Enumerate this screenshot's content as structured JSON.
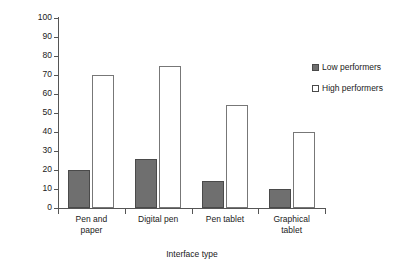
{
  "chart_data": {
    "type": "bar",
    "title": "",
    "xlabel": "Interface type",
    "ylabel": "Percent correct inferences",
    "categories": [
      "Pen and paper",
      "Digital pen",
      "Pen tablet",
      "Graphical tablet"
    ],
    "category_lines": [
      [
        "Pen and",
        "paper"
      ],
      [
        "Digital pen"
      ],
      [
        "Pen tablet"
      ],
      [
        "Graphical",
        "tablet"
      ]
    ],
    "series": [
      {
        "name": "Low performers",
        "values": [
          20,
          26,
          14,
          10
        ],
        "color": "#6f6f6f"
      },
      {
        "name": "High performers",
        "values": [
          70,
          75,
          54,
          40
        ],
        "color": "#ffffff"
      }
    ],
    "ylim": [
      0,
      100
    ],
    "yticks": [
      0,
      10,
      20,
      30,
      40,
      50,
      60,
      70,
      80,
      90,
      100
    ],
    "ytick_labels": [
      "0",
      "10",
      "20",
      "30",
      "40",
      "50",
      "60",
      "70",
      "80",
      "90",
      "100"
    ],
    "grid": false,
    "legend_position": "right"
  },
  "legend": {
    "items": [
      {
        "label": "Low performers",
        "swatch": "filled-square-icon"
      },
      {
        "label": "High performers",
        "swatch": "empty-square-icon"
      }
    ]
  }
}
